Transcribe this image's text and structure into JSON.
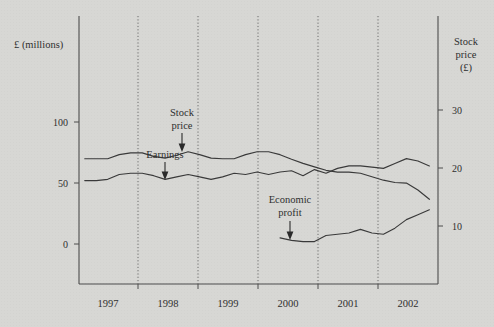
{
  "chart_data": {
    "type": "line",
    "title": "",
    "xlabel": "",
    "ylabel": "£ (millions)",
    "y2label": "Stock price (£)",
    "grid": "vertical-dotted-at-year-boundaries",
    "legend": "none (inline annotations with arrows)",
    "x": [
      1996.6,
      1996.8,
      1997.0,
      1997.2,
      1997.4,
      1997.6,
      1997.8,
      1998.0,
      1998.2,
      1998.4,
      1998.6,
      1998.8,
      1999.0,
      1999.2,
      1999.4,
      1999.6,
      1999.8,
      2000.0,
      2000.2,
      2000.4,
      2000.6,
      2000.8,
      2001.0,
      2001.2,
      2001.4,
      2001.6,
      2001.8,
      2002.0,
      2002.2,
      2002.4,
      2002.6
    ],
    "xlim": [
      1996.5,
      2002.75
    ],
    "ylim": [
      -35,
      135
    ],
    "y2lim": [
      -1.0,
      35.5
    ],
    "y_ticks": [
      0,
      50,
      100
    ],
    "y_tick_labels": [
      "0",
      "50",
      "100"
    ],
    "y2_ticks": [
      10,
      20,
      30
    ],
    "y2_tick_labels": [
      "10",
      "20",
      "30"
    ],
    "x_tick_labels": [
      "1997",
      "1998",
      "1999",
      "2000",
      "2001",
      "2002"
    ],
    "x_tick_positions": [
      1997,
      1998,
      1999,
      2000,
      2001,
      2002
    ],
    "series": [
      {
        "name": "Stock price",
        "axis": "right",
        "unit": "£",
        "values": [
          21.6,
          21.6,
          21.6,
          22.3,
          22.6,
          22.6,
          22.0,
          21.7,
          22.2,
          22.8,
          22.3,
          21.7,
          21.6,
          21.6,
          22.3,
          22.8,
          22.8,
          22.3,
          21.5,
          20.8,
          20.2,
          19.6,
          19.3,
          19.3,
          19.1,
          18.5,
          17.9,
          17.5,
          17.4,
          16.2,
          14.6
        ]
      },
      {
        "name": "Earnings",
        "axis": "left",
        "unit": "£m",
        "values": [
          52,
          52,
          53,
          57,
          58,
          58,
          56,
          53,
          55,
          57,
          55,
          53,
          55,
          58,
          57,
          59,
          57,
          59,
          60,
          56,
          61,
          58,
          62,
          64,
          64,
          63,
          62,
          66,
          70,
          68,
          64
        ]
      },
      {
        "name": "Economic profit",
        "axis": "left",
        "unit": "£m",
        "values": [
          null,
          null,
          null,
          null,
          null,
          null,
          null,
          null,
          null,
          null,
          null,
          null,
          null,
          null,
          null,
          null,
          null,
          5,
          3,
          2,
          2,
          7,
          8,
          9,
          12,
          9,
          8,
          13,
          20,
          24,
          28
        ]
      }
    ],
    "annotations": [
      {
        "text_lines": [
          "Stock",
          "price"
        ],
        "points_to_series": "Stock price",
        "arrow": "down"
      },
      {
        "text_lines": [
          "Earnings"
        ],
        "points_to_series": "Earnings",
        "arrow": "down"
      },
      {
        "text_lines": [
          "Economic",
          "profit"
        ],
        "points_to_series": "Economic profit",
        "arrow": "down"
      }
    ]
  },
  "axes": {
    "left_title": "£ (millions)",
    "right_title_lines": [
      "Stock",
      "price",
      "(£)"
    ],
    "left_ticks": [
      "100",
      "50",
      "0"
    ],
    "right_ticks": [
      "30",
      "20",
      "10"
    ],
    "years": [
      "1997",
      "1998",
      "1999",
      "2000",
      "2001",
      "2002"
    ]
  },
  "annotations": {
    "stock_price_line1": "Stock",
    "stock_price_line2": "price",
    "earnings": "Earnings",
    "economic_profit_line1": "Economic",
    "economic_profit_line2": "profit"
  },
  "colors": {
    "background": "#d7d7d4",
    "ink": "#2f2f2f",
    "axis": "#4c4c4c",
    "series": "#3a3a3a",
    "grid": "#6a6a6a"
  }
}
